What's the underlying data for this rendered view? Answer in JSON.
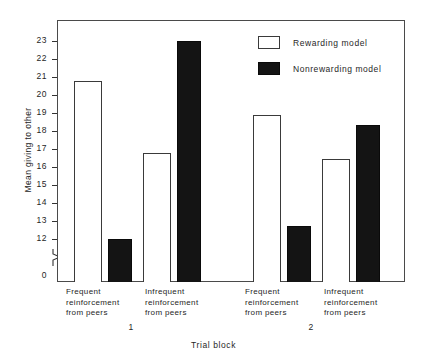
{
  "chart_data": {
    "type": "bar",
    "title": "",
    "xlabel": "Trial block",
    "ylabel": "Mean giving to other",
    "categories": [
      "Frequent reinforcement from peers",
      "Infrequent reinforcement from peers",
      "Frequent reinforcement from peers",
      "Infrequent reinforcement from peers"
    ],
    "group_labels": [
      "1",
      "2"
    ],
    "series": [
      {
        "name": "Rewarding model",
        "style": "open",
        "values": [
          21.0,
          17.6,
          19.4,
          17.3
        ]
      },
      {
        "name": "Nonrewarding model",
        "style": "filled",
        "values": [
          13.5,
          22.9,
          14.1,
          18.9
        ]
      }
    ],
    "ylim": [
      12,
      23.9
    ],
    "yticks": [
      {
        "value": 0,
        "label": "0"
      },
      {
        "value": 12,
        "label": "12"
      },
      {
        "value": 13,
        "label": "13"
      },
      {
        "value": 14,
        "label": "14"
      },
      {
        "value": 15,
        "label": "15"
      },
      {
        "value": 16,
        "label": "16"
      },
      {
        "value": 17,
        "label": "17"
      },
      {
        "value": 18,
        "label": "18"
      },
      {
        "value": 19,
        "label": "19"
      },
      {
        "value": 20,
        "label": "20"
      },
      {
        "value": 21,
        "label": "21"
      },
      {
        "value": 22,
        "label": "22"
      },
      {
        "value": 23,
        "label": "23"
      }
    ],
    "axis_break": true,
    "grid": false,
    "legend_position": "top-right",
    "legend_entries": [
      "Rewarding model",
      "Nonrewarding model"
    ]
  },
  "axis": {
    "ylabel": "Mean giving to other",
    "xlabel": "Trial block"
  },
  "legend": {
    "rewarding_label": "Rewarding model",
    "nonrewarding_label": "Nonrewarding model"
  },
  "categories": {
    "c0_line1": "Frequent",
    "c0_line2": "reinforcement",
    "c0_line3": "from peers",
    "c1_line1": "Infrequent",
    "c1_line2": "reinforcement",
    "c1_line3": "from peers",
    "c2_line1": "Frequent",
    "c2_line2": "reinforcement",
    "c2_line3": "from peers",
    "c3_line1": "Infrequent",
    "c3_line2": "reinforcement",
    "c3_line3": "from peers"
  },
  "blocks": {
    "block1": "1",
    "block2": "2"
  },
  "yticklabels": {
    "t0": "0",
    "t12": "12",
    "t13": "13",
    "t14": "14",
    "t15": "15",
    "t16": "16",
    "t17": "17",
    "t18": "18",
    "t19": "19",
    "t20": "20",
    "t21": "21",
    "t22": "22",
    "t23": "23"
  },
  "colors": {
    "open_bar": "#ffffff",
    "filled_bar": "#141414",
    "axis": "#4a4a4a",
    "text": "#262626"
  }
}
